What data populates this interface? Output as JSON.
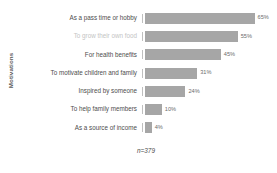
{
  "chart_data": {
    "type": "bar",
    "orientation": "horizontal",
    "title": "",
    "xlabel": "",
    "ylabel": "Motivations",
    "xlim": [
      0,
      70
    ],
    "grid": false,
    "legend": null,
    "annotation": "n=379",
    "value_suffix": "%",
    "categories": [
      "As a pass time or hobby",
      "To grow their own food",
      "For health benefits",
      "To motivate children and family",
      "Inspired by someone",
      "To help family members",
      "As a source of income"
    ],
    "values": [
      65,
      55,
      45,
      31,
      24,
      10,
      4
    ],
    "labels": [
      "65%",
      "55%",
      "45%",
      "31%",
      "24%",
      "10%",
      "4%"
    ],
    "highlighted_index": 1,
    "bars": [
      {
        "category": "As a pass time or hobby",
        "value": 65,
        "label": "65%",
        "muted_label": false
      },
      {
        "category": "To grow their own food",
        "value": 55,
        "label": "55%",
        "muted_label": true
      },
      {
        "category": "For health benefits",
        "value": 45,
        "label": "45%",
        "muted_label": false
      },
      {
        "category": "To motivate children and family",
        "value": 31,
        "label": "31%",
        "muted_label": false
      },
      {
        "category": "Inspired by someone",
        "value": 24,
        "label": "24%",
        "muted_label": false
      },
      {
        "category": "To help family members",
        "value": 10,
        "label": "10%",
        "muted_label": false
      },
      {
        "category": "As a source of income",
        "value": 4,
        "label": "4%",
        "muted_label": false
      }
    ],
    "colors": {
      "bar_fill": "#a6a6a6",
      "label_text": "#4d4d4d",
      "muted_label_text": "#c4c4c4",
      "value_text": "#6b6b6b",
      "tick": "#bfbfbf",
      "background": "#ffffff"
    }
  }
}
